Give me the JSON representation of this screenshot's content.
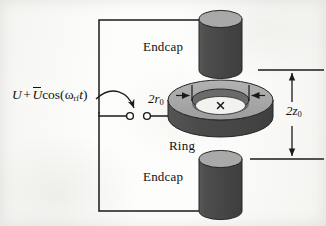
{
  "figure": {
    "kind": "quadrupole-ion-trap-schematic",
    "background_color": "#fdfdfb"
  },
  "labels": {
    "endcap_top": "Endcap",
    "endcap_bottom": "Endcap",
    "ring": "Ring",
    "radial_dimension": "2r",
    "radial_dimension_sub": "0",
    "axial_dimension": "2z",
    "axial_dimension_sub": "0"
  },
  "voltage_source": {
    "dc_term": "U",
    "plus": "+",
    "ac_amplitude": "U",
    "cos": "cos(",
    "omega": "ω",
    "omega_sub": "rf",
    "time": "t",
    "close_paren": ")",
    "full_text": "U + Ŭcos(ωrft)"
  },
  "electrodes": {
    "endcap_top": {
      "name": "Endcap",
      "body_color": "#4a4a4a",
      "top_face_color": "#a9a9a9"
    },
    "endcap_bottom": {
      "name": "Endcap",
      "body_color": "#4a4a4a",
      "top_face_color": "#a9a9a9"
    },
    "ring": {
      "name": "Ring",
      "top_face_color": "#a9a9a9",
      "outer_wall_color": "#4a4a4a",
      "inner_wall_color": "#6d6d6d"
    }
  },
  "annotations": {
    "ion_marker": "x",
    "terminal_left": "terminal",
    "terminal_right": "terminal",
    "pointer_arrow": "curved-arrow-to-terminals"
  },
  "colors": {
    "line": "#1a1a1a",
    "dark_gray": "#4a4a4a",
    "light_gray": "#a9a9a9",
    "mid_gray": "#6d6d6d",
    "paper": "#fdfdfb"
  }
}
